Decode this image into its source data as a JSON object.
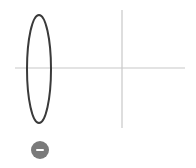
{
  "diagram": {
    "type": "optics-lens-on-axis",
    "colors": {
      "axis": "#c8c8c8",
      "lens_stroke": "#3a3a3a",
      "button": "#7a7a7a",
      "button_glyph": "#ffffff"
    },
    "optical_axis": {
      "x1": 15,
      "y": 68,
      "x2": 185
    },
    "vertical_line": {
      "x": 122,
      "y1": 10,
      "y2": 128
    },
    "lens": {
      "cx": 39,
      "cy": 69,
      "rx": 12,
      "ry": 54
    }
  },
  "controls": {
    "remove_button": {
      "icon": "minus-circle-icon"
    }
  }
}
